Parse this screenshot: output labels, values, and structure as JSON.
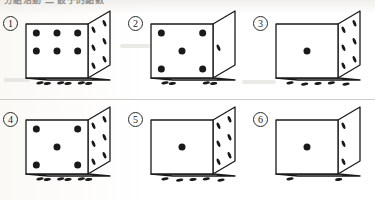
{
  "page": {
    "header_text": "分組活動 二 骰子的點數",
    "divider_visible": true,
    "ink_color": "#1a1a1a",
    "paper_color": "#fdfdfb",
    "width": 375,
    "height": 200
  },
  "dice": [
    {
      "index": 1,
      "label": "1",
      "front_face": 6,
      "right_face": 6,
      "bottom_face": 6,
      "front_pips": [
        [
          1,
          1
        ],
        [
          2,
          1
        ],
        [
          3,
          1
        ],
        [
          1,
          2
        ],
        [
          2,
          2
        ],
        [
          3,
          2
        ]
      ],
      "right_pips": [
        [
          1,
          1
        ],
        [
          2,
          1
        ],
        [
          1,
          2
        ],
        [
          2,
          2
        ],
        [
          1,
          3
        ],
        [
          2,
          3
        ]
      ],
      "bottom_pips": [
        [
          1,
          1
        ],
        [
          2,
          1
        ],
        [
          3,
          1
        ],
        [
          1,
          2
        ],
        [
          2,
          2
        ],
        [
          3,
          2
        ]
      ]
    },
    {
      "index": 2,
      "label": "2",
      "front_face": 5,
      "right_face": 1,
      "bottom_face": 4,
      "front_pips": [
        [
          1,
          1
        ],
        [
          3,
          1
        ],
        [
          2,
          2
        ],
        [
          1,
          3
        ],
        [
          3,
          3
        ]
      ],
      "right_pips": [
        [
          1,
          2
        ]
      ],
      "bottom_pips": [
        [
          1,
          1
        ],
        [
          3,
          1
        ],
        [
          1,
          2
        ],
        [
          3,
          2
        ]
      ]
    },
    {
      "index": 3,
      "label": "3",
      "front_face": 1,
      "right_face": 6,
      "bottom_face": 5,
      "front_pips": [
        [
          2,
          2
        ]
      ],
      "right_pips": [
        [
          1,
          1
        ],
        [
          2,
          1
        ],
        [
          1,
          2
        ],
        [
          2,
          2
        ],
        [
          1,
          3
        ],
        [
          2,
          3
        ]
      ],
      "bottom_pips": [
        [
          1,
          1
        ],
        [
          3,
          1
        ],
        [
          2,
          2
        ],
        [
          1,
          3
        ],
        [
          3,
          3
        ]
      ]
    },
    {
      "index": 4,
      "label": "4",
      "front_face": 5,
      "right_face": 6,
      "bottom_face": 6,
      "front_pips": [
        [
          1,
          1
        ],
        [
          3,
          1
        ],
        [
          2,
          2
        ],
        [
          1,
          3
        ],
        [
          3,
          3
        ]
      ],
      "right_pips": [
        [
          1,
          1
        ],
        [
          2,
          1
        ],
        [
          1,
          2
        ],
        [
          2,
          2
        ],
        [
          1,
          3
        ],
        [
          2,
          3
        ]
      ],
      "bottom_pips": [
        [
          1,
          1
        ],
        [
          2,
          1
        ],
        [
          3,
          1
        ],
        [
          1,
          2
        ],
        [
          2,
          2
        ],
        [
          3,
          2
        ]
      ]
    },
    {
      "index": 5,
      "label": "5",
      "front_face": 1,
      "right_face": 6,
      "bottom_face": 5,
      "front_pips": [
        [
          2,
          2
        ]
      ],
      "right_pips": [
        [
          1,
          1
        ],
        [
          2,
          1
        ],
        [
          1,
          2
        ],
        [
          2,
          2
        ],
        [
          1,
          3
        ],
        [
          2,
          3
        ]
      ],
      "bottom_pips": [
        [
          1,
          1
        ],
        [
          3,
          1
        ],
        [
          2,
          2
        ],
        [
          1,
          3
        ],
        [
          3,
          3
        ]
      ]
    },
    {
      "index": 6,
      "label": "6",
      "front_face": 1,
      "right_face": 3,
      "bottom_face": 2,
      "front_pips": [
        [
          2,
          2
        ]
      ],
      "right_pips": [
        [
          1,
          1
        ],
        [
          1,
          2
        ],
        [
          1,
          3
        ]
      ],
      "bottom_pips": [
        [
          1,
          1
        ],
        [
          3,
          2
        ]
      ]
    }
  ]
}
